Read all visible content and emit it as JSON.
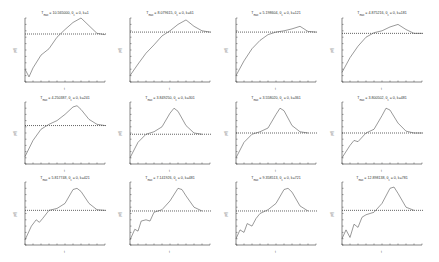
{
  "chart_data": {
    "type": "line",
    "layout": {
      "rows": 3,
      "cols": 4
    },
    "xlabel": "t",
    "ylabel": "p(t)",
    "grid": false,
    "legend": "none",
    "panels": [
      {
        "title": "T_max = 10.565000, θ_c = 0, k=1",
        "title_main": "T",
        "title_sub": "max",
        "title_rest": " = 10.565000, θ",
        "title_sub2": "c",
        "title_tail": " = 0, k=1",
        "threshold": 0.75,
        "x": [
          0,
          0.05,
          0.1,
          0.2,
          0.3,
          0.4,
          0.5,
          0.6,
          0.7,
          0.8,
          0.9,
          1.0
        ],
        "y": [
          0.2,
          0.08,
          0.22,
          0.42,
          0.52,
          0.7,
          0.82,
          0.93,
          1.0,
          0.88,
          0.76,
          0.74
        ]
      },
      {
        "title": "T_max = 8.079615, θ_c = 0, k=61",
        "title_main": "T",
        "title_sub": "max",
        "title_rest": " = 8.079615, θ",
        "title_sub2": "c",
        "title_tail": " = 0, k=61",
        "threshold": 0.78,
        "x": [
          0,
          0.1,
          0.2,
          0.3,
          0.4,
          0.5,
          0.6,
          0.7,
          0.8,
          0.9,
          1.0
        ],
        "y": [
          0.1,
          0.28,
          0.45,
          0.58,
          0.72,
          0.8,
          0.9,
          0.97,
          0.87,
          0.8,
          0.78
        ]
      },
      {
        "title": "T_max = 5.198604, θ_c = 0, k=121",
        "title_main": "T",
        "title_sub": "max",
        "title_rest": " = 5.198604, θ",
        "title_sub2": "c",
        "title_tail": " = 0, k=121",
        "threshold": 0.78,
        "x": [
          0,
          0.1,
          0.2,
          0.3,
          0.4,
          0.5,
          0.6,
          0.7,
          0.8,
          0.9,
          1.0
        ],
        "y": [
          0.1,
          0.33,
          0.52,
          0.65,
          0.74,
          0.78,
          0.8,
          0.83,
          0.87,
          0.79,
          0.78
        ]
      },
      {
        "title": "T_max = 4.875216, θ_c = 0, k=181",
        "title_main": "T",
        "title_sub": "max",
        "title_rest": " = 4.875216, θ",
        "title_sub2": "c",
        "title_tail": " = 0, k=181",
        "threshold": 0.76,
        "x": [
          0,
          0.1,
          0.2,
          0.3,
          0.4,
          0.5,
          0.6,
          0.7,
          0.8,
          0.9,
          1.0
        ],
        "y": [
          0.15,
          0.38,
          0.56,
          0.7,
          0.77,
          0.8,
          0.86,
          0.9,
          0.82,
          0.76,
          0.76
        ]
      },
      {
        "title": "T_max = 4.250387, θ_c = 0, k=241",
        "title_main": "T",
        "title_sub": "max",
        "title_rest": " = 4.250387, θ",
        "title_sub2": "c",
        "title_tail": " = 0, k=241",
        "threshold": 0.62,
        "x": [
          0,
          0.1,
          0.2,
          0.3,
          0.4,
          0.5,
          0.6,
          0.65,
          0.7,
          0.8,
          0.9,
          1.0
        ],
        "y": [
          0.12,
          0.38,
          0.56,
          0.64,
          0.7,
          0.8,
          0.92,
          0.94,
          0.88,
          0.72,
          0.64,
          0.62
        ]
      },
      {
        "title": "T_max = 3.849250, θ_c = 0, k=301",
        "title_main": "T",
        "title_sub": "max",
        "title_rest": " = 3.849250, θ",
        "title_sub2": "c",
        "title_tail": " = 0, k=301",
        "threshold": 0.48,
        "x": [
          0,
          0.1,
          0.2,
          0.3,
          0.4,
          0.5,
          0.55,
          0.6,
          0.7,
          0.8,
          0.9
        ],
        "y": [
          0.1,
          0.35,
          0.48,
          0.52,
          0.6,
          0.82,
          0.9,
          0.85,
          0.62,
          0.5,
          0.48
        ]
      },
      {
        "title": "T_max = 3.558020, θ_c = 0, k=361",
        "title_main": "T",
        "title_sub": "max",
        "title_rest": " = 3.558020, θ",
        "title_sub2": "c",
        "title_tail": " = 0, k=361",
        "threshold": 0.5,
        "x": [
          0,
          0.1,
          0.2,
          0.3,
          0.4,
          0.5,
          0.55,
          0.6,
          0.7,
          0.8,
          0.9
        ],
        "y": [
          0.1,
          0.35,
          0.48,
          0.52,
          0.58,
          0.8,
          0.9,
          0.86,
          0.62,
          0.52,
          0.5
        ]
      },
      {
        "title": "T_max = 3.800502, θ_c = 0, k=481",
        "title_main": "T",
        "title_sub": "max",
        "title_rest": " = 3.800502, θ",
        "title_sub2": "c",
        "title_tail": " = 0, k=481",
        "threshold": 0.5,
        "x": [
          0,
          0.1,
          0.15,
          0.2,
          0.3,
          0.4,
          0.5,
          0.55,
          0.6,
          0.7,
          0.8,
          0.9,
          1.0
        ],
        "y": [
          0.1,
          0.3,
          0.38,
          0.36,
          0.5,
          0.56,
          0.78,
          0.9,
          0.87,
          0.66,
          0.53,
          0.5,
          0.5
        ]
      },
      {
        "title": "T_max = 5.817748, θ_c = 0, k=421",
        "title_main": "T",
        "title_sub": "max",
        "title_rest": " = 5.817748, θ",
        "title_sub2": "c",
        "title_tail": " = 0, k=421",
        "threshold": 0.55,
        "x": [
          0,
          0.08,
          0.14,
          0.18,
          0.22,
          0.3,
          0.4,
          0.5,
          0.6,
          0.65,
          0.7,
          0.8,
          0.9,
          1.0
        ],
        "y": [
          0.08,
          0.3,
          0.4,
          0.36,
          0.42,
          0.55,
          0.58,
          0.66,
          0.88,
          0.9,
          0.85,
          0.66,
          0.56,
          0.55
        ]
      },
      {
        "title": "T_max = 7.141926, θ_c = 0, k=481",
        "title_main": "T",
        "title_sub": "max",
        "title_rest": " = 7.141926, θ",
        "title_sub2": "c",
        "title_tail": " = 0, k=481",
        "threshold": 0.54,
        "x": [
          0,
          0.06,
          0.1,
          0.14,
          0.2,
          0.25,
          0.3,
          0.4,
          0.5,
          0.6,
          0.65,
          0.7,
          0.8,
          0.9
        ],
        "y": [
          0.08,
          0.25,
          0.22,
          0.38,
          0.4,
          0.38,
          0.52,
          0.56,
          0.7,
          0.9,
          0.88,
          0.78,
          0.6,
          0.54
        ]
      },
      {
        "title": "T_max = 9.358513, θ_c = 0, k=721",
        "title_main": "T",
        "title_sub": "max",
        "title_rest": " = 9.358513, θ",
        "title_sub2": "c",
        "title_tail": " = 0, k=721",
        "threshold": 0.54,
        "x": [
          0,
          0.05,
          0.1,
          0.14,
          0.2,
          0.25,
          0.3,
          0.4,
          0.5,
          0.6,
          0.65,
          0.7,
          0.8,
          0.9
        ],
        "y": [
          0.1,
          0.24,
          0.2,
          0.34,
          0.3,
          0.42,
          0.5,
          0.56,
          0.66,
          0.88,
          0.9,
          0.84,
          0.62,
          0.54
        ]
      },
      {
        "title": "T_max = 12.898138, θ_c = 0, k=781",
        "title_main": "T",
        "title_sub": "max",
        "title_rest": " = 12.898138, θ",
        "title_sub2": "c",
        "title_tail": " = 0, k=781",
        "threshold": 0.55,
        "x": [
          0,
          0.05,
          0.1,
          0.15,
          0.2,
          0.25,
          0.3,
          0.4,
          0.5,
          0.6,
          0.65,
          0.7,
          0.8,
          0.9
        ],
        "y": [
          0.1,
          0.24,
          0.12,
          0.33,
          0.28,
          0.44,
          0.48,
          0.52,
          0.66,
          0.9,
          0.92,
          0.82,
          0.6,
          0.55
        ]
      }
    ]
  },
  "axis_labels": {
    "x": "t",
    "y": "p(t)"
  }
}
